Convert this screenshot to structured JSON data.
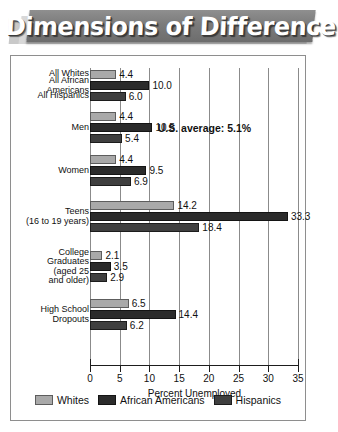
{
  "banner": {
    "title": "Dimensions of Difference"
  },
  "annotation": {
    "us_average": "U.S. average: 5.1%"
  },
  "legend": {
    "items": [
      {
        "label": "Whites",
        "color": "#a9a9a9"
      },
      {
        "label": "African Americans",
        "color": "#2b2b2b"
      },
      {
        "label": "Hispanics",
        "color": "#3f3f3f"
      }
    ]
  },
  "chart_data": {
    "type": "bar",
    "title": "Dimensions of Difference",
    "xlabel": "Percent Unemployed",
    "ylabel": "",
    "xlim": [
      0,
      35
    ],
    "xticks": [
      "0",
      "5",
      "10",
      "15",
      "20",
      "25",
      "30",
      "35"
    ],
    "orientation": "horizontal",
    "grid": true,
    "legend_position": "bottom",
    "annotations": [
      "U.S. average: 5.1%"
    ],
    "categories": [
      "All Whites / All African Americans / All Hispanics",
      "Men",
      "Women",
      "Teens (16 to 19 years)",
      "College Graduates (aged 25 and older)",
      "High School Dropouts"
    ],
    "category_labels": [
      [
        "All Whites",
        "All African\nAmericans",
        "All Hispanics"
      ],
      [
        "Men"
      ],
      [
        "Women"
      ],
      [
        "Teens\n(16 to 19 years)"
      ],
      [
        "College\nGraduates\n(aged 25\nand older)"
      ],
      [
        "High School\nDropouts"
      ]
    ],
    "series": [
      {
        "name": "Whites",
        "values": [
          4.4,
          4.4,
          4.4,
          14.2,
          2.1,
          6.5
        ]
      },
      {
        "name": "African Americans",
        "values": [
          10.0,
          10.5,
          9.5,
          33.3,
          3.5,
          14.4
        ]
      },
      {
        "name": "Hispanics",
        "values": [
          6.0,
          5.4,
          6.9,
          18.4,
          2.9,
          6.2
        ]
      }
    ],
    "value_labels": [
      [
        "4.4",
        "10.0",
        "6.0"
      ],
      [
        "4.4",
        "10.5",
        "5.4"
      ],
      [
        "4.4",
        "9.5",
        "6.9"
      ],
      [
        "14.2",
        "33.3",
        "18.4"
      ],
      [
        "2.1",
        "3.5",
        "2.9"
      ],
      [
        "6.5",
        "14.4",
        "6.2"
      ]
    ]
  }
}
